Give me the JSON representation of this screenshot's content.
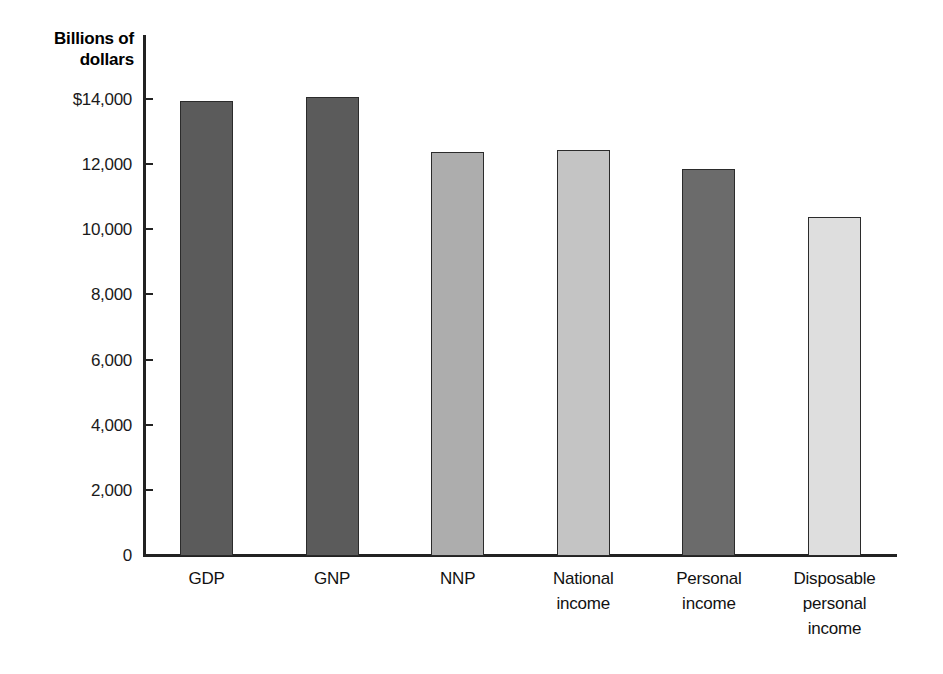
{
  "chart_data": {
    "type": "bar",
    "title": "",
    "ylabel": "Billions of dollars",
    "xlabel": "",
    "categories": [
      "GDP",
      "GNP",
      "NNP",
      "National income",
      "Personal income",
      "Disposable personal income"
    ],
    "category_lines": [
      [
        "GDP"
      ],
      [
        "GNP"
      ],
      [
        "NNP"
      ],
      [
        "National",
        "income"
      ],
      [
        "Personal",
        "income"
      ],
      [
        "Disposable",
        "personal",
        "income"
      ]
    ],
    "values": [
      13950,
      14050,
      12370,
      12430,
      11850,
      10380
    ],
    "ylim": [
      0,
      14000
    ],
    "ytick_values": [
      0,
      2000,
      4000,
      6000,
      8000,
      10000,
      12000,
      14000
    ],
    "ytick_labels": [
      "0",
      "2,000",
      "4,000",
      "6,000",
      "8,000",
      "10,000",
      "12,000",
      "$14,000"
    ],
    "grid": false,
    "legend": "none",
    "bar_colors": [
      "#5b5b5b",
      "#5b5b5b",
      "#adadad",
      "#c4c4c4",
      "#6b6b6b",
      "#dedede"
    ],
    "bar_border_color": "#2b2b2b"
  }
}
